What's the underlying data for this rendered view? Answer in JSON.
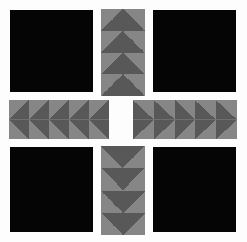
{
  "figure": {
    "background_color": "#fdfdfd",
    "width": 247,
    "height": 242
  },
  "palette": {
    "solid_black": "#050505",
    "arrow_light_gray": "#868686",
    "arrow_dark_gray": "#585858",
    "page_background": "#fdfdfd"
  },
  "grid": {
    "columns": 3,
    "rows": 3,
    "description": "3x3 arrangement: solid black squares at the four corners, gray arrow strips at the four edge midpoints pointing inward, empty center"
  },
  "panels": [
    {
      "id": "panel-top-left",
      "name": "solid-panel-top-left",
      "kind": "solid",
      "fill": "#050505",
      "x": 10,
      "y": 10,
      "w": 83,
      "h": 82,
      "arrow_direction": "",
      "tile_count": 0
    },
    {
      "id": "panel-top-center",
      "name": "arrow-strip-top-center",
      "kind": "arrows",
      "fill": "",
      "x": 101,
      "y": 9,
      "w": 44,
      "h": 87,
      "arrow_direction": "down",
      "tile_count": 4
    },
    {
      "id": "panel-top-right",
      "name": "solid-panel-top-right",
      "kind": "solid",
      "fill": "#050505",
      "x": 153,
      "y": 10,
      "w": 83,
      "h": 82,
      "arrow_direction": "",
      "tile_count": 0
    },
    {
      "id": "panel-middle-left",
      "name": "arrow-strip-middle-left",
      "kind": "arrows",
      "fill": "",
      "x": 9,
      "y": 100,
      "w": 100,
      "h": 39,
      "arrow_direction": "right",
      "tile_count": 5
    },
    {
      "id": "panel-middle-right",
      "name": "arrow-strip-middle-right",
      "kind": "arrows",
      "fill": "",
      "x": 133,
      "y": 100,
      "w": 104,
      "h": 39,
      "arrow_direction": "left",
      "tile_count": 5
    },
    {
      "id": "panel-bottom-left",
      "name": "solid-panel-bottom-left",
      "kind": "solid",
      "fill": "#050505",
      "x": 10,
      "y": 147,
      "w": 83,
      "h": 85,
      "arrow_direction": "",
      "tile_count": 0
    },
    {
      "id": "panel-bottom-center",
      "name": "arrow-strip-bottom-center",
      "kind": "arrows",
      "fill": "",
      "x": 101,
      "y": 146,
      "w": 44,
      "h": 89,
      "arrow_direction": "up",
      "tile_count": 4
    },
    {
      "id": "panel-bottom-right",
      "name": "solid-panel-bottom-right",
      "kind": "solid",
      "fill": "#050505",
      "x": 153,
      "y": 147,
      "w": 83,
      "h": 85,
      "arrow_direction": "",
      "tile_count": 0
    }
  ]
}
